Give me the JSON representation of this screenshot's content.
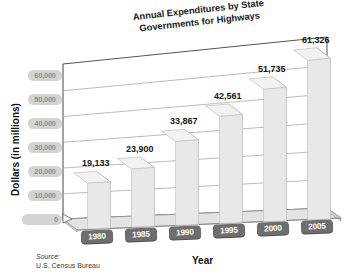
{
  "chart_data": {
    "type": "bar",
    "title": "Annual Expenditures by State Governments for Highways",
    "title_line1": "Annual Expenditures by State",
    "title_line2": "Governments for Highways",
    "xlabel": "Year",
    "ylabel": "Dollars (in millions)",
    "categories": [
      "1980",
      "1985",
      "1990",
      "1995",
      "2000",
      "2005"
    ],
    "values": [
      19133,
      23900,
      33867,
      42561,
      51735,
      61326
    ],
    "value_labels": [
      "19,133",
      "23,900",
      "33,867",
      "42,561",
      "51,735",
      "61,326"
    ],
    "ytick_values": [
      0,
      10000,
      20000,
      30000,
      40000,
      50000,
      60000
    ],
    "ytick_labels": [
      "0",
      "10,000",
      "20,000",
      "30,000",
      "40,000",
      "50,000",
      "60,000"
    ],
    "ylim": [
      0,
      65000
    ],
    "grid": true,
    "legend": "none",
    "style": "3d-perspective",
    "bar_color": "#e8e8e8",
    "bar_side_color": "#c9c9c9",
    "bar_top_color": "#f2f2f2",
    "grid_color": "#aaaaaa",
    "axis_color": "#555555",
    "ytag_bg": "#d3d3d3",
    "ytag_text": "#8e8e8e",
    "xtag_bg": "#6e6e6e",
    "xtag_text": "#ffffff",
    "label_color": "#151515"
  },
  "source": {
    "label": "Source:",
    "text": "U.S. Census Bureau"
  }
}
